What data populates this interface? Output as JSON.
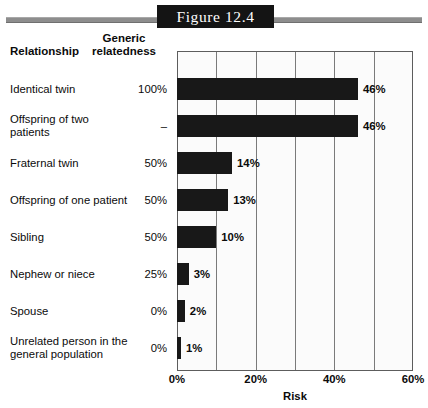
{
  "figure": {
    "banner_label": "Figure 12.4",
    "banner_bg": "#141414",
    "rule_color": "#8d8d8d"
  },
  "headers": {
    "relationship": "Relationship",
    "generic_relatedness": "Generic\nrelatedness"
  },
  "chart_data": {
    "type": "bar",
    "orientation": "horizontal",
    "title": "Figure 12.4",
    "xlabel": "Risk",
    "ylabel": "",
    "xlim": [
      0,
      60
    ],
    "xticks": [
      0,
      20,
      40,
      60
    ],
    "xtick_labels": [
      "0%",
      "20%",
      "40%",
      "60%"
    ],
    "gridlines": [
      10,
      20,
      30,
      40,
      50
    ],
    "grid": true,
    "legend": "none",
    "bar_color": "#181818",
    "plot_bg": "#fbfbfb",
    "categories": [
      "Identical twin",
      "Offspring of two patients",
      "Fraternal twin",
      "Offspring of one patient",
      "Sibling",
      "Nephew or niece",
      "Spouse",
      "Unrelated person in the general population"
    ],
    "values": [
      46,
      46,
      14,
      13,
      10,
      3,
      2,
      1
    ],
    "value_labels": [
      "46%",
      "46%",
      "14%",
      "13%",
      "10%",
      "3%",
      "2%",
      "1%"
    ],
    "generic_relatedness": [
      "100%",
      "–",
      "50%",
      "50%",
      "50%",
      "25%",
      "0%",
      "0%"
    ]
  },
  "rows": [
    {
      "label": "Identical twin",
      "relatedness": "100%",
      "value": 46,
      "value_label": "46%"
    },
    {
      "label": "Offspring of two patients",
      "relatedness": "–",
      "value": 46,
      "value_label": "46%"
    },
    {
      "label": "Fraternal twin",
      "relatedness": "50%",
      "value": 14,
      "value_label": "14%"
    },
    {
      "label": "Offspring of one patient",
      "relatedness": "50%",
      "value": 13,
      "value_label": "13%"
    },
    {
      "label": "Sibling",
      "relatedness": "50%",
      "value": 10,
      "value_label": "10%"
    },
    {
      "label": "Nephew or niece",
      "relatedness": "25%",
      "value": 3,
      "value_label": "3%"
    },
    {
      "label": "Spouse",
      "relatedness": "0%",
      "value": 2,
      "value_label": "2%"
    },
    {
      "label": "Unrelated person in the\ngeneral population",
      "relatedness": "0%",
      "value": 1,
      "value_label": "1%"
    }
  ]
}
